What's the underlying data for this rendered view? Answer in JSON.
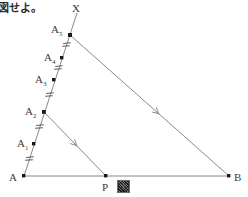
{
  "figure": {
    "caption_text": "図せよ。",
    "background_color": "#ffffff",
    "line_color": "#6e6e6e",
    "point_color": "#1a1a1a",
    "label_color": "#3c3c3c",
    "labels": {
      "A": "A",
      "A1": "A",
      "A1_sub": "1",
      "A2": "A",
      "A2_sub": "2",
      "A3": "A",
      "A3_sub": "3",
      "A4": "A",
      "A4_sub": "4",
      "A5": "A",
      "A5_sub": "5",
      "X": "X",
      "P": "P",
      "B": "B"
    },
    "points": {
      "A": {
        "x": 24,
        "y": 176
      },
      "A1": {
        "x": 34,
        "y": 144
      },
      "A2": {
        "x": 44,
        "y": 112
      },
      "A3": {
        "x": 54,
        "y": 80
      },
      "A4": {
        "x": 62,
        "y": 58
      },
      "A5": {
        "x": 70,
        "y": 35
      },
      "X": {
        "x": 76,
        "y": 14
      },
      "P": {
        "x": 106,
        "y": 176
      },
      "B": {
        "x": 229,
        "y": 176
      }
    },
    "segments": [
      {
        "name": "base-line-AB",
        "from": "A",
        "to": "B"
      },
      {
        "name": "ray-AX",
        "from": "A",
        "to": "X"
      },
      {
        "name": "line-A5-B",
        "from": "A5",
        "to": "B"
      },
      {
        "name": "line-A2-P",
        "from": "A2",
        "to": "P"
      }
    ],
    "tick_marks": {
      "style": "double-hatch",
      "count": 5,
      "description": "equal spacing marks between A-A1, A1-A2, A2-A3, A3-A4, A4-A5"
    },
    "arrow_marks": [
      {
        "name": "arrow-on-A5-B",
        "segment": "line-A5-B",
        "t": 0.55
      },
      {
        "name": "arrow-on-A2-P",
        "segment": "line-A2-P",
        "t": 0.52
      }
    ]
  }
}
